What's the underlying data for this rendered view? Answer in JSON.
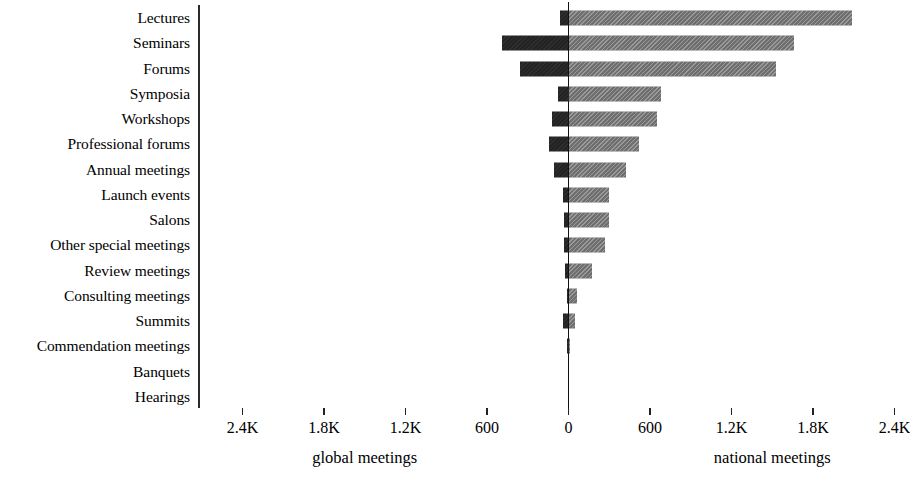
{
  "chart_data": {
    "type": "bar",
    "orientation": "horizontal-diverging",
    "title": "",
    "subtitle": "",
    "xlabel": "",
    "ylabel": "",
    "grid": false,
    "legend_position": "none",
    "axis_left_title": "global meetings",
    "axis_right_title": "national meetings",
    "categories": [
      "Lectures",
      "Seminars",
      "Forums",
      "Symposia",
      "Workshops",
      "Professional forums",
      "Annual meetings",
      "Launch events",
      "Salons",
      "Other special meetings",
      "Review meetings",
      "Consulting meetings",
      "Summits",
      "Commendation meetings",
      "Banquets",
      "Hearings"
    ],
    "series": [
      {
        "name": "global meetings",
        "side": "left",
        "color": "#232323",
        "values": [
          60,
          490,
          358,
          75,
          120,
          140,
          105,
          40,
          35,
          35,
          25,
          10,
          40,
          8,
          0,
          0
        ]
      },
      {
        "name": "national meetings",
        "side": "right",
        "color": "#6f6f6f",
        "values": [
          2090,
          1660,
          1530,
          680,
          650,
          520,
          425,
          300,
          295,
          270,
          170,
          60,
          45,
          10,
          0,
          0
        ]
      }
    ],
    "x_ticks_left": [
      "2.4K",
      "1.8K",
      "1.2K",
      "600"
    ],
    "x_tick_values_left": [
      2400,
      1800,
      1200,
      600
    ],
    "x_tick_zero": "0",
    "x_ticks_right": [
      "600",
      "1.2K",
      "1.8K",
      "2.4K"
    ],
    "x_tick_values_right": [
      600,
      1200,
      1800,
      2400
    ],
    "xlim_left": [
      0,
      2700
    ],
    "xlim_right": [
      0,
      2700
    ]
  }
}
